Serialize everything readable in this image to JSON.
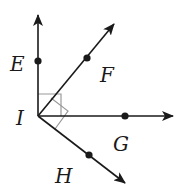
{
  "diagram": {
    "vertex": {
      "label": "I",
      "x": 38,
      "y": 116
    },
    "rays": [
      {
        "name": "E",
        "label": "E",
        "tip": [
          38,
          15
        ],
        "point": [
          38,
          61
        ],
        "label_pos": [
          10,
          71
        ]
      },
      {
        "name": "F",
        "label": "F",
        "tip": [
          114,
          24
        ],
        "point": [
          87,
          58
        ],
        "label_pos": [
          100,
          82
        ]
      },
      {
        "name": "G",
        "label": "G",
        "tip": [
          173,
          116
        ],
        "point": [
          125,
          116
        ],
        "label_pos": [
          113,
          151
        ]
      },
      {
        "name": "H",
        "label": "H",
        "tip": [
          125,
          183
        ],
        "point": [
          89,
          155
        ],
        "label_pos": [
          55,
          183
        ]
      }
    ],
    "right_angles": [
      {
        "between": [
          "IE",
          "IG"
        ]
      },
      {
        "between": [
          "IF",
          "IH"
        ]
      }
    ],
    "colors": {
      "line": "#1a1a1a",
      "marker": "#9a9a9a",
      "text": "#1a1a1a"
    }
  }
}
